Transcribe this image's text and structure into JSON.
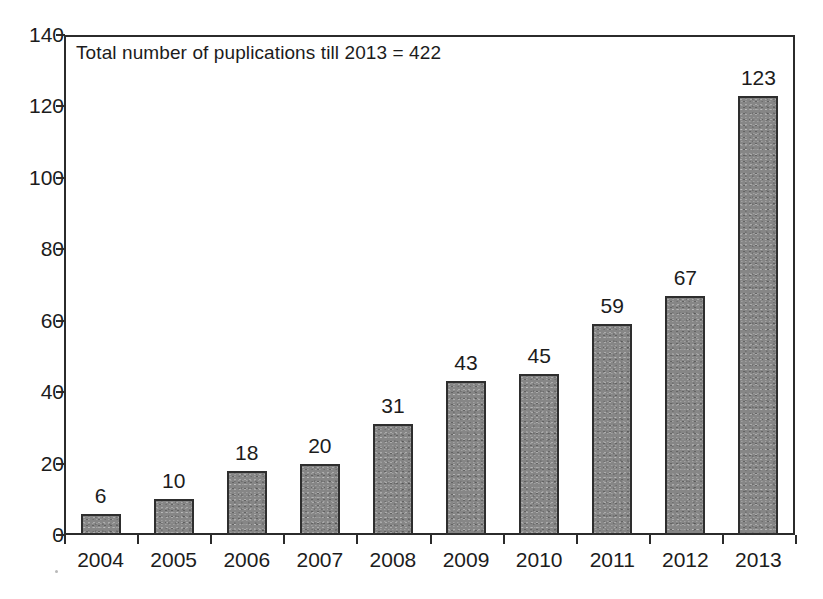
{
  "chart_data": {
    "type": "bar",
    "title": "",
    "subtitle": "",
    "xlabel": "",
    "ylabel": "",
    "categories": [
      "2004",
      "2005",
      "2006",
      "2007",
      "2008",
      "2009",
      "2010",
      "2011",
      "2012",
      "2013"
    ],
    "values": [
      6,
      10,
      18,
      20,
      31,
      43,
      45,
      59,
      67,
      123
    ],
    "value_labels": [
      "6",
      "10",
      "18",
      "20",
      "31",
      "43",
      "45",
      "59",
      "67",
      "123"
    ],
    "ylim": [
      0,
      140
    ],
    "ytick_labels": [
      "0",
      "20",
      "40",
      "60",
      "80",
      "100",
      "120",
      "140"
    ],
    "ytick_values": [
      0,
      20,
      40,
      60,
      80,
      100,
      120,
      140
    ],
    "grid": false,
    "legend": "none",
    "annotation": "Total number of puplications till 2013 = 422",
    "bar_color": "#868686",
    "bar_border_color": "#2e2e2e",
    "axis_color": "#2b2b2b",
    "background_color": "#ffffff",
    "text_color": "#1c1c1c"
  }
}
